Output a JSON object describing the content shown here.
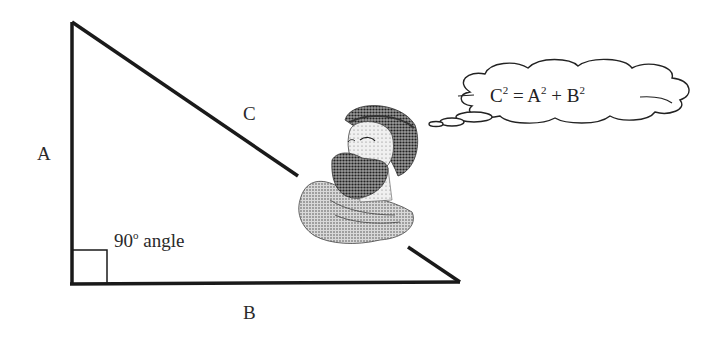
{
  "diagram": {
    "labels": {
      "side_a": "A",
      "side_b": "B",
      "side_c": "C",
      "angle_value": "90",
      "angle_degree": "o",
      "angle_word": "angle"
    },
    "thought_bubble": {
      "c": "C",
      "c_exp": "2",
      "eq": "=",
      "a": "A",
      "a_exp": "2",
      "plus": "+",
      "b": "B",
      "b_exp": "2"
    },
    "figure": "bust-of-pythagoras",
    "colors": {
      "line": "#1a1a1a",
      "background": "#ffffff"
    }
  }
}
